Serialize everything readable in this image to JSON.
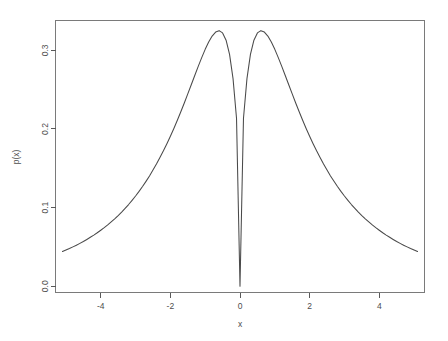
{
  "chart_data": {
    "type": "line",
    "title": "",
    "subtitle": "",
    "xlabel": "x",
    "ylabel": "p(x)",
    "xlim": [
      -5.3,
      5.3
    ],
    "ylim": [
      -0.008,
      0.338
    ],
    "xticks": [
      -4,
      -2,
      0,
      2,
      4
    ],
    "xtick_labels": [
      "-4",
      "-2",
      "0",
      "2",
      "4"
    ],
    "yticks": [
      0.0,
      0.1,
      0.2,
      0.3
    ],
    "ytick_labels": [
      "0.0",
      "0.1",
      "0.2",
      "0.3"
    ],
    "grid": false,
    "legend": null,
    "series": [
      {
        "name": "p(x)",
        "color": "#4a4a4a",
        "x": [
          -5.1,
          -5.0,
          -4.9,
          -4.8,
          -4.7,
          -4.6,
          -4.5,
          -4.4,
          -4.3,
          -4.2,
          -4.1,
          -4.0,
          -3.9,
          -3.8,
          -3.7,
          -3.6,
          -3.5,
          -3.4,
          -3.3,
          -3.2,
          -3.1,
          -3.0,
          -2.9,
          -2.8,
          -2.7,
          -2.6,
          -2.5,
          -2.4,
          -2.3,
          -2.2,
          -2.1,
          -2.0,
          -1.9,
          -1.8,
          -1.7,
          -1.6,
          -1.5,
          -1.4,
          -1.3,
          -1.2,
          -1.1,
          -1.0,
          -0.9,
          -0.8,
          -0.7,
          -0.6,
          -0.5,
          -0.4,
          -0.3,
          -0.2,
          -0.1,
          0.0,
          0.1,
          0.2,
          0.3,
          0.4,
          0.5,
          0.6,
          0.7,
          0.8,
          0.9,
          1.0,
          1.1,
          1.2,
          1.3,
          1.4,
          1.5,
          1.6,
          1.7,
          1.8,
          1.9,
          2.0,
          2.1,
          2.2,
          2.3,
          2.4,
          2.5,
          2.6,
          2.7,
          2.8,
          2.9,
          3.0,
          3.1,
          3.2,
          3.3,
          3.4,
          3.5,
          3.6,
          3.7,
          3.8,
          3.9,
          4.0,
          4.1,
          4.2,
          4.3,
          4.4,
          4.5,
          4.6,
          4.7,
          4.8,
          4.9,
          5.0,
          5.1
        ],
        "y": [
          0.0441,
          0.046,
          0.0479,
          0.05,
          0.0522,
          0.0545,
          0.0569,
          0.0595,
          0.0622,
          0.065,
          0.068,
          0.0712,
          0.0745,
          0.078,
          0.0818,
          0.0857,
          0.0899,
          0.0943,
          0.099,
          0.1039,
          0.1092,
          0.1147,
          0.1206,
          0.1268,
          0.1334,
          0.1403,
          0.1477,
          0.1554,
          0.1636,
          0.1722,
          0.1813,
          0.1908,
          0.2007,
          0.2111,
          0.2219,
          0.2331,
          0.2446,
          0.2563,
          0.268,
          0.2796,
          0.2908,
          0.3013,
          0.3106,
          0.3182,
          0.3233,
          0.3251,
          0.3222,
          0.313,
          0.2949,
          0.264,
          0.2136,
          0.0,
          0.2136,
          0.264,
          0.2949,
          0.313,
          0.3222,
          0.3251,
          0.3233,
          0.3182,
          0.3106,
          0.3013,
          0.2908,
          0.2796,
          0.268,
          0.2563,
          0.2446,
          0.2331,
          0.2219,
          0.2111,
          0.2007,
          0.1908,
          0.1813,
          0.1722,
          0.1636,
          0.1554,
          0.1477,
          0.1403,
          0.1334,
          0.1268,
          0.1206,
          0.1147,
          0.1092,
          0.1039,
          0.099,
          0.0943,
          0.0899,
          0.0857,
          0.0818,
          0.078,
          0.0745,
          0.0712,
          0.068,
          0.065,
          0.0622,
          0.0595,
          0.0569,
          0.0545,
          0.0522,
          0.05,
          0.0479,
          0.046,
          0.0441
        ]
      }
    ],
    "annotations": [],
    "peak_left": {
      "x": -1.3,
      "y": 0.327
    },
    "peak_right": {
      "x": 1.3,
      "y": 0.327
    },
    "minimum": {
      "x": 0.0,
      "y": 0.0
    }
  },
  "colors": {
    "curve": "#4a4a4a",
    "frame": "#7a7a7a",
    "axis": "#595959",
    "text": "#4d4d4d",
    "background": "#ffffff"
  }
}
